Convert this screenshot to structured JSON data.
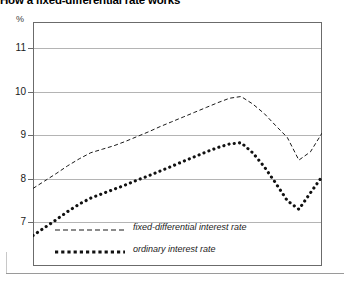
{
  "title": "How a fixed-differential rate works",
  "unit_label": "%",
  "legend": {
    "items": [
      {
        "label": "fixed-differential interest rate",
        "style": "dashed"
      },
      {
        "label": "ordinary interest rate",
        "style": "dotted"
      }
    ]
  },
  "chart_data": {
    "type": "line",
    "title": "How a fixed-differential rate works",
    "xlabel": "",
    "ylabel": "%",
    "ylim": [
      6.0,
      11.6
    ],
    "yticks": [
      7,
      8,
      9,
      10,
      11
    ],
    "ytick_labels": [
      "7",
      "8",
      "9",
      "10",
      "11"
    ],
    "xlim": [
      0,
      100
    ],
    "xticks": [],
    "xtick_labels": [],
    "grid": true,
    "legend_position": "inside-bottom-left",
    "series": [
      {
        "name": "fixed-differential interest rate",
        "style": "dashed",
        "color": "#1a1a1a",
        "x": [
          0,
          4,
          8,
          12,
          16,
          20,
          24,
          28,
          32,
          36,
          40,
          44,
          48,
          52,
          56,
          60,
          64,
          68,
          72,
          76,
          80,
          84,
          88,
          92,
          96,
          100
        ],
        "values": [
          7.78,
          7.95,
          8.12,
          8.3,
          8.46,
          8.6,
          8.68,
          8.76,
          8.86,
          8.97,
          9.08,
          9.2,
          9.31,
          9.42,
          9.53,
          9.64,
          9.75,
          9.85,
          9.89,
          9.72,
          9.5,
          9.22,
          8.95,
          8.43,
          8.62,
          9.05
        ]
      },
      {
        "name": "ordinary interest rate",
        "style": "dotted",
        "color": "#111111",
        "x": [
          0,
          4,
          8,
          12,
          16,
          20,
          24,
          28,
          32,
          36,
          40,
          44,
          48,
          52,
          56,
          60,
          64,
          68,
          72,
          76,
          80,
          84,
          88,
          92,
          96,
          100
        ],
        "values": [
          6.7,
          6.88,
          7.06,
          7.25,
          7.42,
          7.56,
          7.66,
          7.76,
          7.86,
          7.97,
          8.07,
          8.18,
          8.29,
          8.4,
          8.51,
          8.62,
          8.72,
          8.8,
          8.83,
          8.6,
          8.28,
          7.9,
          7.5,
          7.3,
          7.68,
          8.05
        ]
      }
    ],
    "annotations": [
      {
        "text": "constant differential of about 1.0-1.1 percentage points between the two series"
      }
    ]
  }
}
